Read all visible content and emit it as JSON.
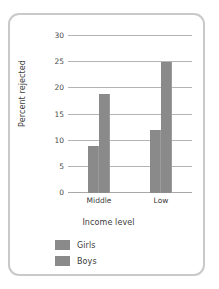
{
  "artifact": {
    "top_text": ""
  },
  "chart_data": {
    "type": "bar",
    "title": "",
    "subtitle": "",
    "xlabel": "Income level",
    "ylabel": "Percent rejected",
    "categories": [
      "Middle",
      "Low"
    ],
    "series": [
      {
        "name": "Girls",
        "values": [
          9,
          12
        ]
      },
      {
        "name": "Boys",
        "values": [
          19,
          25
        ]
      }
    ],
    "grouping_note": "Two adjacent bars per income level; left bar Girls, right bar Boys",
    "ylim": [
      0,
      30
    ],
    "ytick_values": [
      0,
      5,
      10,
      15,
      20,
      25,
      30
    ],
    "ytick_labels": [
      "0",
      "5",
      "10",
      "15",
      "20",
      "25",
      "30"
    ],
    "grid": "horizontal",
    "legend_position": "below-axis-left",
    "legend_entries": [
      "Girls",
      "Boys"
    ],
    "colors": {
      "bar": "#8a8a8a",
      "gridline": "#b4b4b4",
      "frame": "#c9c9c9",
      "text": "#3b3b3b",
      "background": "#ffffff"
    }
  }
}
